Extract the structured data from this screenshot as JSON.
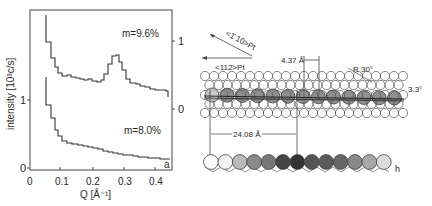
{
  "panel_a": {
    "label": "a",
    "ylabel": "intensity [10³c/s]",
    "xlabel": "Q [Å⁻¹]",
    "left_ticks": [
      "0",
      "1"
    ],
    "right_ticks": [
      "0",
      "1"
    ],
    "x_ticks": [
      "0",
      "0.1",
      "0.2",
      "0.3",
      "0.4"
    ],
    "curve_labels": [
      "m=9.6%",
      "m=8.0%"
    ]
  },
  "panel_b": {
    "label": "h",
    "dir_110": "<1̄ 10>Pt",
    "dir_112": "<112̄>Pt",
    "spacing_small": "4.37 Å",
    "spacing_large": "24.08 Å",
    "rotation": "R 30°",
    "angle": "3.3°"
  },
  "chart_data": {
    "type": "line",
    "title": "",
    "xlabel": "Q [Å⁻¹]",
    "ylabel": "intensity [10³ c/s]",
    "xlim": [
      0,
      0.44
    ],
    "ylim_left": [
      0,
      2.3
    ],
    "right_axis": "offset scale for m=9.6% curve (0 and 1 ticks)",
    "grid": false,
    "legend": "inline text labels",
    "series": [
      {
        "name": "m=9.6%",
        "axis": "right",
        "x": [
          0.05,
          0.055,
          0.07,
          0.08,
          0.09,
          0.1,
          0.12,
          0.14,
          0.16,
          0.18,
          0.2,
          0.22,
          0.24,
          0.25,
          0.27,
          0.28,
          0.29,
          0.3,
          0.32,
          0.34,
          0.36,
          0.38,
          0.4,
          0.42,
          0.43
        ],
        "values": [
          2.0,
          1.0,
          0.75,
          0.62,
          0.52,
          0.48,
          0.45,
          0.42,
          0.4,
          0.38,
          0.36,
          0.35,
          0.4,
          0.55,
          0.75,
          0.8,
          0.72,
          0.58,
          0.4,
          0.36,
          0.33,
          0.3,
          0.27,
          0.26,
          0.18
        ]
      },
      {
        "name": "m=8.0%",
        "axis": "left",
        "x": [
          0.05,
          0.055,
          0.07,
          0.08,
          0.09,
          0.1,
          0.12,
          0.15,
          0.2,
          0.25,
          0.3,
          0.35,
          0.4,
          0.43
        ],
        "values": [
          1.3,
          0.93,
          0.74,
          0.56,
          0.48,
          0.4,
          0.36,
          0.33,
          0.28,
          0.23,
          0.18,
          0.15,
          0.12,
          0.1
        ]
      }
    ]
  }
}
